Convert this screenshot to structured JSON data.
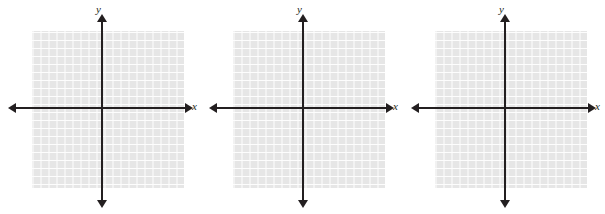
{
  "figure": {
    "title": "",
    "panel_count": 3,
    "background_color": "#ffffff"
  },
  "axis": {
    "x_label": "x",
    "y_label": "y",
    "axis_color": "#231f20"
  },
  "grid": {
    "cell_color": "#e6e6e6",
    "line_color": "#fdfdfd",
    "cell_size_px": 8,
    "columns": 19,
    "rows": 20
  },
  "panels": [
    {
      "name": "panel-1",
      "x_label": "x",
      "y_label": "y"
    },
    {
      "name": "panel-2",
      "x_label": "x",
      "y_label": "y"
    },
    {
      "name": "panel-3",
      "x_label": "x",
      "y_label": "y"
    }
  ],
  "chart_data": {
    "type": "scatter",
    "title": "",
    "xlabel": "x",
    "ylabel": "y",
    "series": [],
    "x": [],
    "values": [],
    "grid": true,
    "legend": false,
    "note": "Blank coordinate planes with no plotted data; grid squares only"
  }
}
